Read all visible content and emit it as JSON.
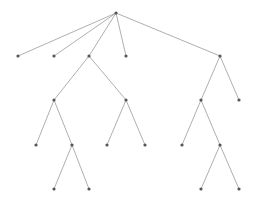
{
  "diagram": {
    "type": "tree",
    "colors": {
      "edge": "#9a9a9a",
      "node": "#555555",
      "background": "#ffffff"
    },
    "nodes": [
      {
        "id": "n0",
        "x": 116,
        "y": 13
      },
      {
        "id": "n1",
        "x": 18,
        "y": 56
      },
      {
        "id": "n2",
        "x": 54,
        "y": 56
      },
      {
        "id": "n3",
        "x": 89,
        "y": 56
      },
      {
        "id": "n4",
        "x": 126,
        "y": 56
      },
      {
        "id": "n5",
        "x": 220,
        "y": 56
      },
      {
        "id": "n6",
        "x": 54,
        "y": 100
      },
      {
        "id": "n7",
        "x": 126,
        "y": 100
      },
      {
        "id": "n8",
        "x": 201,
        "y": 100
      },
      {
        "id": "n9",
        "x": 239,
        "y": 100
      },
      {
        "id": "n10",
        "x": 36,
        "y": 145
      },
      {
        "id": "n11",
        "x": 72,
        "y": 145
      },
      {
        "id": "n12",
        "x": 107,
        "y": 145
      },
      {
        "id": "n13",
        "x": 145,
        "y": 145
      },
      {
        "id": "n14",
        "x": 182,
        "y": 145
      },
      {
        "id": "n15",
        "x": 220,
        "y": 145
      },
      {
        "id": "n16",
        "x": 54,
        "y": 189
      },
      {
        "id": "n17",
        "x": 89,
        "y": 189
      },
      {
        "id": "n18",
        "x": 201,
        "y": 189
      },
      {
        "id": "n19",
        "x": 239,
        "y": 189
      }
    ],
    "edges": [
      [
        "n0",
        "n1"
      ],
      [
        "n0",
        "n2"
      ],
      [
        "n0",
        "n3"
      ],
      [
        "n0",
        "n4"
      ],
      [
        "n0",
        "n5"
      ],
      [
        "n3",
        "n6"
      ],
      [
        "n3",
        "n7"
      ],
      [
        "n5",
        "n8"
      ],
      [
        "n5",
        "n9"
      ],
      [
        "n6",
        "n10"
      ],
      [
        "n6",
        "n11"
      ],
      [
        "n7",
        "n12"
      ],
      [
        "n7",
        "n13"
      ],
      [
        "n8",
        "n14"
      ],
      [
        "n8",
        "n15"
      ],
      [
        "n11",
        "n16"
      ],
      [
        "n11",
        "n17"
      ],
      [
        "n15",
        "n18"
      ],
      [
        "n15",
        "n19"
      ]
    ]
  }
}
